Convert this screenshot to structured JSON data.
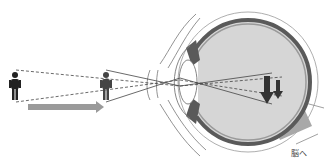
{
  "diagram": {
    "labels": {
      "to_brain": "脳へ"
    },
    "elements": {
      "far_person": "person-far",
      "near_person": "person-near",
      "approach_arrow": "arrow-right",
      "eye": "eyeball-cross-section",
      "optic_nerve": "optic-nerve",
      "retina_images": [
        "inverted-image-far",
        "inverted-image-near"
      ]
    },
    "colors": {
      "line": "#444444",
      "eye_fill": "#d6d6d6",
      "eye_wall": "#5a5a5a",
      "arrow": "#9a9a9a",
      "nerve": "#a8a8a8",
      "person": "#222222"
    }
  }
}
